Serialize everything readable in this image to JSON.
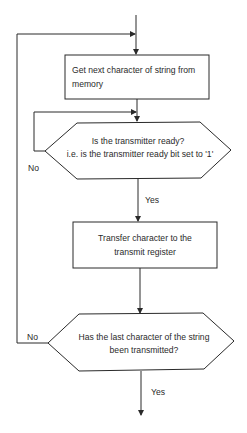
{
  "flowchart": {
    "nodes": [
      {
        "id": "get_char",
        "type": "process",
        "lines": [
          "Get next character of string from",
          "memory"
        ]
      },
      {
        "id": "tx_ready",
        "type": "decision",
        "lines": [
          "Is the transmitter ready?",
          "i.e. is the transmitter ready bit set to '1'"
        ]
      },
      {
        "id": "transfer",
        "type": "process",
        "lines": [
          "Transfer character to the",
          "transmit register"
        ]
      },
      {
        "id": "last_char",
        "type": "decision",
        "lines": [
          "Has the last character of the string",
          "been transmitted?"
        ]
      }
    ],
    "edges": [
      {
        "from": "start",
        "to": "get_char",
        "label": ""
      },
      {
        "from": "get_char",
        "to": "tx_ready",
        "label": ""
      },
      {
        "from": "tx_ready",
        "to": "tx_ready",
        "label": "No"
      },
      {
        "from": "tx_ready",
        "to": "transfer",
        "label": "Yes"
      },
      {
        "from": "transfer",
        "to": "last_char",
        "label": ""
      },
      {
        "from": "last_char",
        "to": "get_char",
        "label": "No"
      },
      {
        "from": "last_char",
        "to": "end",
        "label": "Yes"
      }
    ],
    "labels": {
      "tx_ready_no": "No",
      "tx_ready_yes": "Yes",
      "last_char_no": "No",
      "last_char_yes": "Yes"
    }
  }
}
